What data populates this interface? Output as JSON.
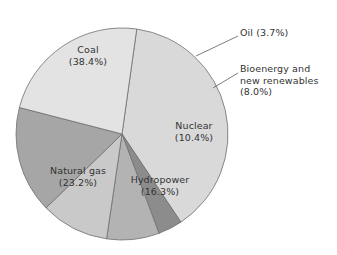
{
  "chart_data": {
    "type": "pie",
    "title": "",
    "subtitle": "",
    "xlabel": "",
    "ylabel": "",
    "legend_position": "none",
    "grid": false,
    "units": "percent",
    "categories": [
      "Coal",
      "Oil",
      "Bioenergy and new renewables",
      "Nuclear",
      "Hydropower",
      "Natural gas"
    ],
    "values": [
      38.4,
      3.7,
      8.0,
      10.4,
      16.3,
      23.2
    ],
    "slices": [
      {
        "name": "Coal",
        "label": "Coal",
        "value": 38.4,
        "value_text": "(38.4%)",
        "color": "#d9d9d9",
        "label_placement": "inside"
      },
      {
        "name": "Oil",
        "label": "Oil (3.7%)",
        "value": 3.7,
        "value_text": "(3.7%)",
        "color": "#8c8c8c",
        "label_placement": "callout"
      },
      {
        "name": "Bioenergy and new renewables",
        "label_line1": "Bioenergy and",
        "label_line2": "new renewables",
        "label_line3": "(8.0%)",
        "value": 8.0,
        "value_text": "(8.0%)",
        "color": "#b3b3b3",
        "label_placement": "callout"
      },
      {
        "name": "Nuclear",
        "label": "Nuclear",
        "value": 10.4,
        "value_text": "(10.4%)",
        "color": "#c9c9c9",
        "label_placement": "inside"
      },
      {
        "name": "Hydropower",
        "label": "Hydropower",
        "value": 16.3,
        "value_text": "(16.3%)",
        "color": "#a6a6a6",
        "label_placement": "inside"
      },
      {
        "name": "Natural gas",
        "label": "Natural gas",
        "value": 23.2,
        "value_text": "(23.2%)",
        "color": "#e3e3e3",
        "label_placement": "inside"
      }
    ]
  },
  "labels": {
    "coal_name": "Coal",
    "coal_value": "(38.4%)",
    "natural_gas_name": "Natural gas",
    "natural_gas_value": "(23.2%)",
    "hydropower_name": "Hydropower",
    "hydropower_value": "(16.3%)",
    "nuclear_name": "Nuclear",
    "nuclear_value": "(10.4%)",
    "oil_callout": "Oil (3.7%)",
    "bioenergy_line1": "Bioenergy and",
    "bioenergy_line2": "new renewables",
    "bioenergy_line3": "(8.0%)"
  },
  "style": {
    "outline_color": "#6e6e6e",
    "leader_line_color": "#6e6e6e",
    "background": "#ffffff"
  }
}
